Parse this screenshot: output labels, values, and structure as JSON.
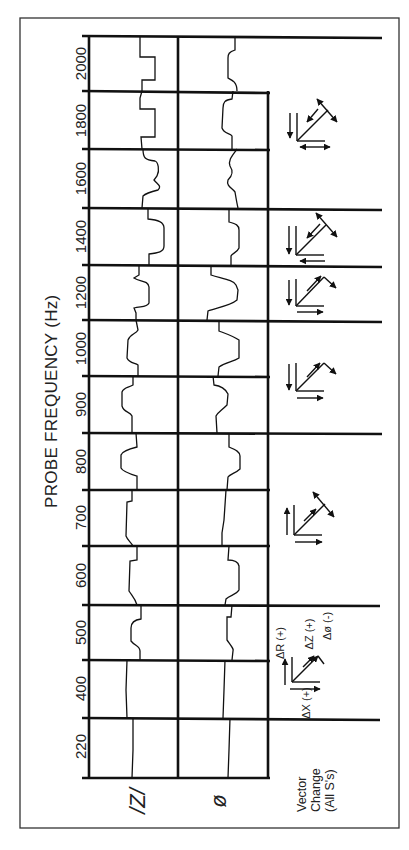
{
  "title": "PROBE FREQUENCY (Hz)",
  "row_labels": {
    "impedance": "/Z/",
    "phase": "ø"
  },
  "frequencies": [
    "2000",
    "1800",
    "1600",
    "1400",
    "1200",
    "1000",
    "900",
    "800",
    "700",
    "600",
    "500",
    "400",
    "220"
  ],
  "vector_change_label": "Vector\nChange\n(All S's)",
  "legend": {
    "delta_r": "ΔR (+)",
    "delta_x": "ΔX (+)",
    "delta_z": "ΔZ (+)",
    "delta_phi": "Δø (-)"
  },
  "colors": {
    "line": "#111111",
    "background": "#ffffff",
    "border": "#333333"
  }
}
